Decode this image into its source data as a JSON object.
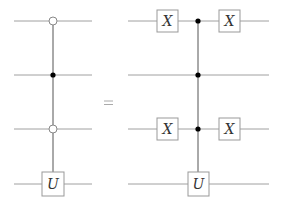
{
  "diagram": {
    "type": "quantum-circuit-identity",
    "relation": "=",
    "wire_color": "#a0a0a0",
    "control_line_color": "#555555",
    "box_border_color": "#999999",
    "wires_y": [
      21,
      75,
      129,
      184
    ],
    "left_circuit": {
      "wire_x": [
        14,
        92
      ],
      "control_x": 53,
      "controls": [
        {
          "wire": 0,
          "type": "open"
        },
        {
          "wire": 1,
          "type": "closed"
        },
        {
          "wire": 2,
          "type": "open"
        }
      ],
      "target": {
        "wire": 3,
        "label": "U"
      }
    },
    "right_circuit": {
      "wire_x": [
        128,
        269
      ],
      "control_x": 198,
      "gates_before": [
        {
          "wire": 0,
          "label": "X",
          "x": 167
        },
        {
          "wire": 2,
          "label": "X",
          "x": 167
        }
      ],
      "controls": [
        {
          "wire": 0,
          "type": "closed"
        },
        {
          "wire": 1,
          "type": "closed"
        },
        {
          "wire": 2,
          "type": "closed"
        }
      ],
      "target": {
        "wire": 3,
        "label": "U"
      },
      "gates_after": [
        {
          "wire": 0,
          "label": "X",
          "x": 229
        },
        {
          "wire": 2,
          "label": "X",
          "x": 229
        }
      ]
    },
    "labels": {
      "equals": "=",
      "x_gate": "X",
      "u_gate": "U"
    }
  }
}
